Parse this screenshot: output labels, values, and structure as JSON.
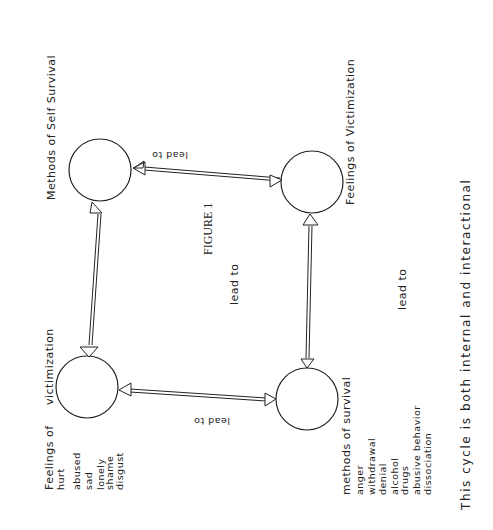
{
  "figure": {
    "title": "FIGURE 1",
    "footnote": "This cycle is both internal and interactional"
  },
  "nodes": [
    {
      "id": "feelings-victimization-top",
      "label": "Feelings of Victimization",
      "items": []
    },
    {
      "id": "methods-self-survival",
      "label": "Methods of Self Survival",
      "items": []
    },
    {
      "id": "feelings-victimization-bottom",
      "label_line1": "Feelings of",
      "label_line2": "victimization",
      "items": [
        "hurt",
        "abused",
        "sad",
        "lonely",
        "shame",
        "disgust"
      ]
    },
    {
      "id": "methods-survival",
      "label": "methods of survival",
      "items": [
        "anger",
        "withdrawal",
        "denial",
        "alcohol",
        "drugs",
        "abusive behavior",
        "dissociation"
      ]
    }
  ],
  "edges": [
    {
      "from": "feelings-victimization-top",
      "to": "methods-self-survival",
      "label": "lead to"
    },
    {
      "from": "methods-self-survival",
      "to": "feelings-victimization-bottom",
      "label": "lead to"
    },
    {
      "from": "feelings-victimization-bottom",
      "to": "methods-survival",
      "label": "lead to"
    },
    {
      "from": "methods-survival",
      "to": "feelings-victimization-top",
      "label": "lead to"
    }
  ],
  "colors": {
    "ink": "#222222",
    "paper": "#ffffff"
  }
}
